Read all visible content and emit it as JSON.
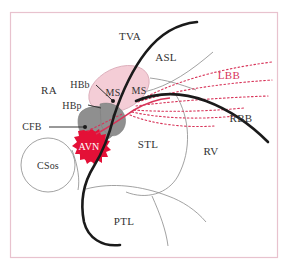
{
  "figure": {
    "type": "anatomical-diagram",
    "frame_color": "#e8c2ce",
    "background_color": "#ffffff"
  },
  "colors": {
    "avn_red": "#e41037",
    "bundle_red": "#d8355a",
    "membranous_septum_pink": "#f4cdd6",
    "central_fibrous_gray": "#8f8f8f",
    "valve_black": "#1a1a1a",
    "thin_outline": "#8a8a8a",
    "text_dark": "#333333"
  },
  "labels": {
    "tva": {
      "text": "TVA",
      "meaning": "tricuspid valve annulus",
      "color": "#333333"
    },
    "asl": {
      "text": "ASL",
      "meaning": "anterosuperior leaflet",
      "color": "#333333"
    },
    "lbb": {
      "text": "LBB",
      "meaning": "left bundle branch",
      "color": "#d8355a"
    },
    "rbb": {
      "text": "RBB",
      "meaning": "right bundle branch",
      "color": "#333333"
    },
    "ra": {
      "text": "RA",
      "meaning": "right atrium",
      "color": "#333333"
    },
    "rv": {
      "text": "RV",
      "meaning": "right ventricle",
      "color": "#333333"
    },
    "stl": {
      "text": "STL",
      "meaning": "septal leaflet",
      "color": "#333333"
    },
    "ptl": {
      "text": "PTL",
      "meaning": "posterior leaflet",
      "color": "#333333"
    },
    "hbb": {
      "text": "HBb",
      "meaning": "branching His bundle",
      "color": "#333333"
    },
    "hbp": {
      "text": "HBp",
      "meaning": "penetrating His bundle",
      "color": "#333333"
    },
    "cfb": {
      "text": "CFB",
      "meaning": "central fibrous body",
      "color": "#333333"
    },
    "avn": {
      "text": "AVN",
      "meaning": "atrioventricular node",
      "color": "#ffffff"
    },
    "csos": {
      "text": "CSos",
      "meaning": "coronary sinus ostium",
      "color": "#333333"
    },
    "ms_left": {
      "text": "MS",
      "meaning": "membranous septum atrioventricular component",
      "color": "#333333"
    },
    "ms_right": {
      "text": "MS",
      "meaning": "membranous septum interventricular component",
      "color": "#333333"
    }
  },
  "structures": [
    {
      "name": "membranous-septum",
      "shape": "ellipse",
      "fill": "#f4cdd6"
    },
    {
      "name": "central-fibrous-body",
      "shape": "blob",
      "fill": "#8f8f8f"
    },
    {
      "name": "av-node",
      "shape": "spiky-star",
      "fill": "#e41037"
    },
    {
      "name": "coronary-sinus-ostium",
      "shape": "circle",
      "fill": "none"
    },
    {
      "name": "tricuspid-annulus",
      "shape": "thick-curve",
      "stroke": "#1a1a1a"
    },
    {
      "name": "left-bundle-fascicles",
      "shape": "dotted-fan",
      "stroke": "#d8355a"
    },
    {
      "name": "right-bundle-branch",
      "shape": "dotted-curve",
      "stroke": "#d8355a"
    }
  ]
}
